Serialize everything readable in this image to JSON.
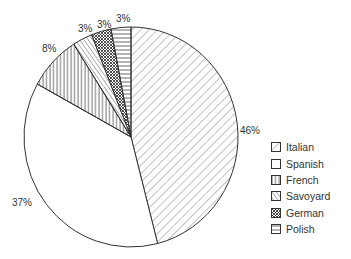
{
  "chart_data": {
    "type": "pie",
    "title": "",
    "categories": [
      "Italian",
      "Spanish",
      "French",
      "Savoyard",
      "German",
      "Polish"
    ],
    "values": [
      46,
      37,
      8,
      3,
      3,
      3
    ],
    "labels": [
      "46%",
      "37%",
      "8%",
      "3%",
      "3%",
      "3%"
    ],
    "patterns": [
      "diagonal-forward",
      "blank",
      "vertical",
      "diagonal-back",
      "crosshatch",
      "horizontal"
    ],
    "start_angle": "12 o'clock",
    "direction": "clockwise",
    "legend_position": "right-bottom"
  },
  "legend": {
    "items": [
      {
        "label": "Italian",
        "pattern": "diagonal-forward"
      },
      {
        "label": "Spanish",
        "pattern": "blank"
      },
      {
        "label": "French",
        "pattern": "vertical"
      },
      {
        "label": "Savoyard",
        "pattern": "diagonal-back"
      },
      {
        "label": "German",
        "pattern": "crosshatch"
      },
      {
        "label": "Polish",
        "pattern": "horizontal"
      }
    ]
  },
  "colors": {
    "stroke": "#333333",
    "hatch": "#555555",
    "background": "#ffffff"
  }
}
